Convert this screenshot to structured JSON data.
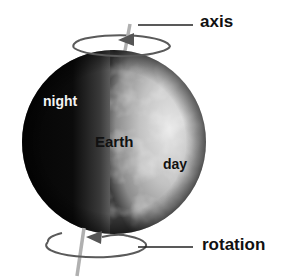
{
  "diagram": {
    "labels": {
      "axis": "axis",
      "rotation": "rotation",
      "night": "night",
      "earth": "Earth",
      "day": "day"
    },
    "colors": {
      "background": "#ffffff",
      "night_side": "#0a0a0a",
      "day_side": "#b8b8b8",
      "axis_line": "#aaaaaa",
      "rotation_ring": "#555555",
      "leader_line": "#222222",
      "label_text": "#111111",
      "night_label_text": "#f4f4f4"
    }
  }
}
